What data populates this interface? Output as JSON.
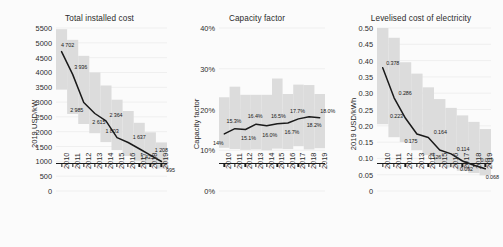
{
  "figure": {
    "background": "#fbfbfb",
    "band_color": "#dcdcdc",
    "line_color": "#1a1a1a"
  },
  "chart_data": [
    {
      "type": "line",
      "title": "Total installed cost",
      "ylabel": "2019 USD/kW",
      "xlabel": "",
      "categories": [
        "2010",
        "2011",
        "2012",
        "2013",
        "2014",
        "2015",
        "2016",
        "2017",
        "2018",
        "2019"
      ],
      "values": [
        4702,
        3936,
        2985,
        2615,
        2364,
        1803,
        1637,
        1425,
        1208,
        995
      ],
      "value_labels": [
        "4 702",
        "3 936",
        "2 985",
        "2 615",
        "2 364",
        "1 803",
        "1 637",
        "1 425",
        "1 208",
        "995"
      ],
      "ylim": [
        0,
        5500
      ],
      "yticks": [
        0,
        500,
        1000,
        1500,
        2000,
        2500,
        3000,
        3500,
        4000,
        4500,
        5000,
        5500
      ],
      "ytick_labels": [
        "0",
        "500",
        "1000",
        "1500",
        "2000",
        "2500",
        "3000",
        "3500",
        "4000",
        "4500",
        "5000",
        "5500"
      ],
      "band_low": [
        3420,
        2600,
        2260,
        1950,
        1650,
        1380,
        1180,
        1020,
        880,
        760
      ],
      "band_high": [
        5460,
        5100,
        4560,
        4000,
        3560,
        3080,
        2700,
        2300,
        1980,
        1640
      ],
      "grid": true,
      "legend": "none"
    },
    {
      "type": "line",
      "title": "Capacity factor",
      "ylabel": "Capacity factor",
      "xlabel": "",
      "categories": [
        "2010",
        "2011",
        "2012",
        "2013",
        "2014",
        "2015",
        "2016",
        "2017",
        "2018",
        "2019"
      ],
      "values": [
        14.0,
        15.3,
        15.1,
        16.4,
        16.0,
        16.5,
        16.7,
        17.7,
        18.2,
        18.0
      ],
      "value_labels": [
        "14%",
        "15.3%",
        "15.1%",
        "16.4%",
        "16.0%",
        "16.5%",
        "16.7%",
        "17.7%",
        "18.2%",
        "18.0%"
      ],
      "ylim": [
        0,
        40
      ],
      "yticks": [
        0,
        10,
        20,
        30,
        40
      ],
      "ytick_labels": [
        "0%",
        "10%",
        "20%",
        "30%",
        "40%"
      ],
      "band_low": [
        10.6,
        10.3,
        10.1,
        10.2,
        10.0,
        10.4,
        10.3,
        11.0,
        10.2,
        10.5
      ],
      "band_high": [
        23.0,
        25.6,
        23.6,
        23.6,
        23.6,
        27.6,
        23.8,
        26.1,
        26.0,
        23.8
      ],
      "grid": true,
      "legend": "none"
    },
    {
      "type": "line",
      "title": "Levelised cost of electricity",
      "ylabel": "2019 USD/kWh",
      "xlabel": "",
      "categories": [
        "2010",
        "2011",
        "2012",
        "2013",
        "2014",
        "2015",
        "2016",
        "2017",
        "2018",
        "2019"
      ],
      "values": [
        0.378,
        0.286,
        0.223,
        0.175,
        0.164,
        0.126,
        0.114,
        0.092,
        0.079,
        0.068
      ],
      "value_labels": [
        "0.378",
        "0.286",
        "0.223",
        "0.175",
        "0.164",
        "0.126",
        "0.114",
        "0.092",
        "0.079",
        "0.068"
      ],
      "ylim": [
        0,
        0.5
      ],
      "yticks": [
        0,
        0.05,
        0.1,
        0.15,
        0.2,
        0.25,
        0.3,
        0.35,
        0.4,
        0.45,
        0.5
      ],
      "ytick_labels": [
        "0",
        "0.05",
        "0.10",
        "0.15",
        "0.20",
        "0.25",
        "0.30",
        "0.35",
        "0.40",
        "0.45",
        "0.50"
      ],
      "band_low": [
        0.205,
        0.165,
        0.15,
        0.125,
        0.11,
        0.082,
        0.072,
        0.062,
        0.055,
        0.048
      ],
      "band_high": [
        0.5,
        0.47,
        0.395,
        0.36,
        0.318,
        0.282,
        0.255,
        0.232,
        0.212,
        0.19
      ],
      "grid": true,
      "legend": "none"
    }
  ]
}
